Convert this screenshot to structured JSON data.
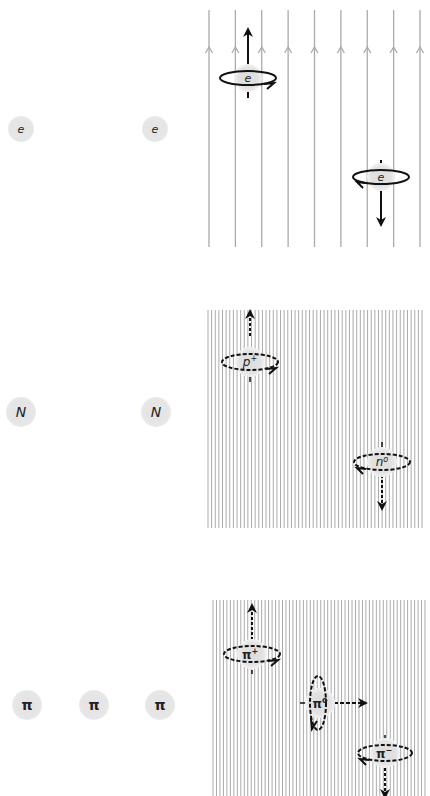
{
  "panels": [
    {
      "id": "electron",
      "free_particles": [
        "e",
        "e"
      ],
      "field_lines": 9,
      "field_arrow_direction": "up",
      "particles": [
        {
          "label": "e",
          "spin": "up",
          "arrow": "solid",
          "rotation": "counter-clockwise-front"
        },
        {
          "label": "e",
          "spin": "down",
          "arrow": "solid",
          "rotation": "clockwise-front"
        }
      ]
    },
    {
      "id": "nucleon",
      "free_particles": [
        "N",
        "N"
      ],
      "field_lines": 60,
      "particles": [
        {
          "label": "p",
          "superscript": "+",
          "spin": "up",
          "arrow": "dashed"
        },
        {
          "label": "n",
          "superscript": "o",
          "spin": "down",
          "arrow": "dashed"
        }
      ]
    },
    {
      "id": "pion",
      "free_particles": [
        "π",
        "π",
        "π"
      ],
      "field_lines": 62,
      "particles": [
        {
          "label": "π",
          "superscript": "+",
          "spin": "up",
          "arrow": "dashed"
        },
        {
          "label": "π",
          "superscript": "o",
          "spin": "sideways",
          "arrow": "dashed"
        },
        {
          "label": "π",
          "superscript": "−",
          "spin": "down",
          "arrow": "dashed"
        }
      ]
    }
  ],
  "colors": {
    "field_line": "#aaaaaa",
    "particle_fill": "#e2e2e2",
    "arrow": "#111111"
  }
}
